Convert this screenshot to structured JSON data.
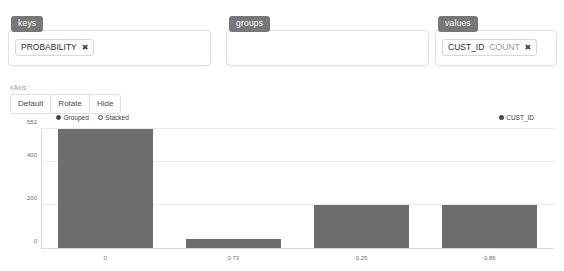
{
  "zones": [
    {
      "id": "keys",
      "badge": "keys",
      "chips": [
        {
          "main": "PROBABILITY",
          "sub": "",
          "remove": "✖"
        }
      ]
    },
    {
      "id": "groups",
      "badge": "groups",
      "chips": []
    },
    {
      "id": "values",
      "badge": "values",
      "chips": [
        {
          "main": "CUST_ID",
          "sub": "COUNT",
          "remove": "✖"
        }
      ]
    }
  ],
  "axis_control": {
    "label": "xAxis :",
    "buttons": [
      "Default",
      "Rotate",
      "Hide"
    ]
  },
  "mode_legend": {
    "options": [
      {
        "label": "Grouped",
        "selected": true
      },
      {
        "label": "Stacked",
        "selected": false
      }
    ]
  },
  "series_legend": {
    "items": [
      {
        "label": "CUST_ID",
        "color": "#4a4a4a"
      }
    ]
  },
  "colors": {
    "bar": "#6e6e6e",
    "badge": "#777777",
    "grid": "#ededed",
    "axis": "#d9d9d9",
    "tick_text": "#6f6f6f"
  },
  "chart_data": {
    "type": "bar",
    "title": "",
    "xlabel": "",
    "ylabel": "",
    "categories": [
      "0",
      "0.73",
      "0.25",
      "0.86"
    ],
    "values": [
      552,
      40,
      200,
      200
    ],
    "series": [
      {
        "name": "CUST_ID",
        "values": [
          552,
          40,
          200,
          200
        ],
        "color": "#6e6e6e"
      }
    ],
    "ylim": [
      0,
      552
    ],
    "yticks": [
      0,
      200,
      400,
      552
    ],
    "ytick_labels": [
      "0",
      "200",
      "400",
      "552"
    ],
    "grid": true,
    "legend_position": "top-right",
    "bar_mode": "Grouped"
  }
}
